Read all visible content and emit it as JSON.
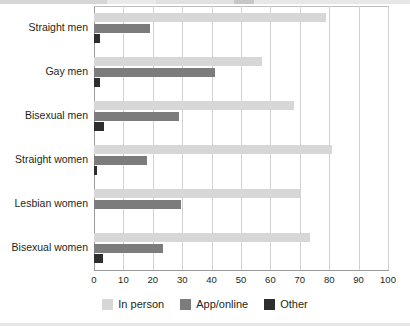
{
  "chart_data": {
    "type": "bar",
    "orientation": "horizontal",
    "title": "",
    "subtitle": "",
    "xlabel": "",
    "ylabel": "",
    "xlim": [
      0,
      100
    ],
    "xticks": [
      "0",
      "10",
      "20",
      "30",
      "40",
      "50",
      "60",
      "70",
      "80",
      "90",
      "100"
    ],
    "grid": true,
    "legend_position": "bottom",
    "categories": [
      "Straight men",
      "Gay men",
      "Bisexual men",
      "Straight women",
      "Lesbian women",
      "Bisexual women"
    ],
    "series": [
      {
        "name": "In person",
        "color": "#d7d7d7",
        "values": [
          79,
          57,
          68,
          81,
          70,
          73.5
        ]
      },
      {
        "name": "App/online",
        "color": "#7c7c7c",
        "values": [
          19,
          41,
          29,
          18,
          29.5,
          23.5
        ]
      },
      {
        "name": "Other",
        "color": "#2e2e2e",
        "values": [
          2,
          2,
          3.5,
          1,
          0,
          3
        ]
      }
    ]
  },
  "legend": {
    "items": [
      {
        "label": "In person",
        "swatch_name": "legend-swatch-in-person",
        "color": "#d7d7d7"
      },
      {
        "label": "App/online",
        "swatch_name": "legend-swatch-app-online",
        "color": "#7c7c7c"
      },
      {
        "label": "Other",
        "swatch_name": "legend-swatch-other",
        "color": "#2e2e2e"
      }
    ]
  }
}
